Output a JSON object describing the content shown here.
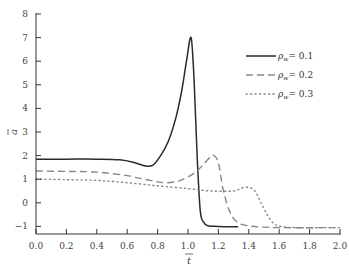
{
  "chart_data": {
    "type": "line",
    "title": "",
    "xlabel": "t̄",
    "ylabel": "ā",
    "xlim": [
      0.0,
      2.0
    ],
    "ylim": [
      -1.5,
      8
    ],
    "xticks": [
      "0.0",
      "0.2",
      "0.4",
      "0.6",
      "0.8",
      "1.0",
      "1.2",
      "1.4",
      "1.6",
      "1.8",
      "2.0"
    ],
    "yticks": [
      "−1",
      "0",
      "1",
      "2",
      "3",
      "4",
      "5",
      "6",
      "7",
      "8"
    ],
    "grid": false,
    "legend_position": "upper right",
    "series": [
      {
        "name": "ρw = 0.1",
        "style": "solid",
        "color": "#2a2a2a",
        "x": [
          0.0,
          0.2,
          0.4,
          0.55,
          0.65,
          0.72,
          0.77,
          0.82,
          0.87,
          0.92,
          0.96,
          0.99,
          1.02,
          1.04,
          1.06,
          1.08,
          1.1,
          1.13,
          1.2,
          1.33
        ],
        "y": [
          1.85,
          1.85,
          1.85,
          1.82,
          1.7,
          1.56,
          1.6,
          2.0,
          2.6,
          3.6,
          4.8,
          6.0,
          7.0,
          5.2,
          2.0,
          -0.3,
          -0.8,
          -0.97,
          -1.0,
          -1.02
        ]
      },
      {
        "name": "ρw = 0.2",
        "style": "dashed",
        "color": "#888888",
        "x": [
          0.0,
          0.2,
          0.4,
          0.6,
          0.75,
          0.85,
          0.95,
          1.05,
          1.11,
          1.15,
          1.17,
          1.2,
          1.23,
          1.27,
          1.32,
          1.4,
          1.6,
          2.0
        ],
        "y": [
          1.35,
          1.33,
          1.3,
          1.15,
          0.95,
          0.85,
          0.95,
          1.3,
          1.7,
          1.95,
          2.0,
          1.7,
          0.6,
          -0.3,
          -0.8,
          -0.98,
          -1.05,
          -1.05
        ]
      },
      {
        "name": "ρw = 0.3",
        "style": "dotted",
        "color": "#888888",
        "x": [
          0.0,
          0.2,
          0.4,
          0.6,
          0.8,
          1.0,
          1.15,
          1.3,
          1.35,
          1.4,
          1.44,
          1.48,
          1.52,
          1.56,
          1.6,
          1.7,
          2.0
        ],
        "y": [
          1.0,
          0.98,
          0.95,
          0.85,
          0.72,
          0.6,
          0.5,
          0.5,
          0.62,
          0.65,
          0.5,
          0.0,
          -0.5,
          -0.85,
          -0.98,
          -1.05,
          -1.05
        ]
      }
    ]
  },
  "legend": {
    "items": [
      {
        "label": "ρw = 0.1",
        "sub": "w",
        "base": "ρ",
        "value": "= 0.1"
      },
      {
        "label": "ρw = 0.2",
        "sub": "w",
        "base": "ρ",
        "value": "= 0.2"
      },
      {
        "label": "ρw = 0.3",
        "sub": "w",
        "base": "ρ",
        "value": "= 0.3"
      }
    ]
  },
  "axes": {
    "x_label_base": "t",
    "y_label_base": "a"
  }
}
